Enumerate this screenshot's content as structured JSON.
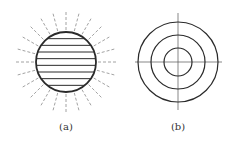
{
  "figure": {
    "panels": [
      {
        "id": "a",
        "label": "(a)",
        "description": "Circle with horizontal hatch lines and dashed radial rays",
        "center": [
          66,
          62
        ],
        "radius": 30,
        "ray_outer_radius": 52,
        "ray_count": 24,
        "hatch_line_count": 8,
        "label_pos": [
          66,
          121
        ]
      },
      {
        "id": "b",
        "label": "(b)",
        "description": "Three concentric circles with crosshair center lines",
        "center": [
          178,
          62
        ],
        "radii": [
          14,
          27,
          40
        ],
        "crosshair": {
          "x_range": [
            135,
            222
          ],
          "y_range": [
            13,
            110
          ]
        },
        "label_pos": [
          178,
          121
        ]
      }
    ],
    "colors": {
      "stroke": "#2a2a2a",
      "thin_line": "#555555",
      "ray": "#8a8a8a",
      "text": "#333333"
    }
  }
}
